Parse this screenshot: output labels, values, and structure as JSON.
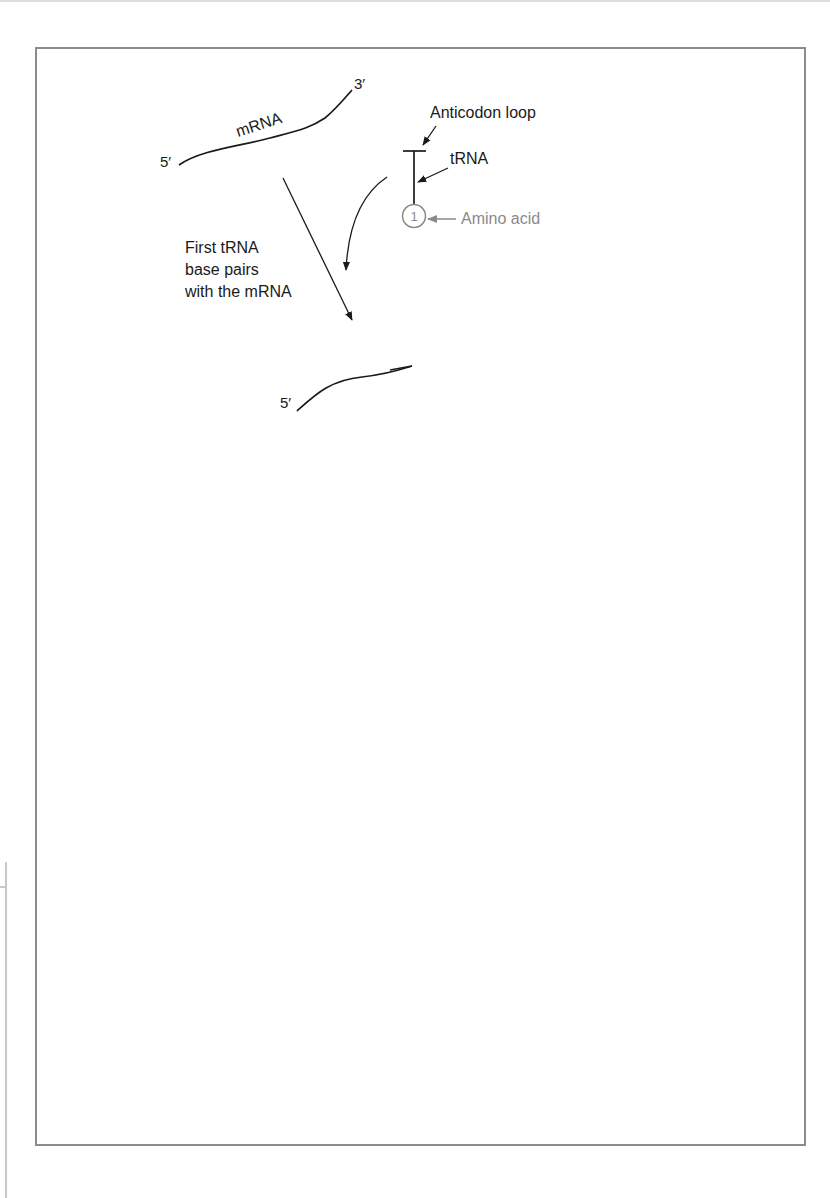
{
  "figure": {
    "colors": {
      "line": "#1a1a1a",
      "amino_acid": "#8a8a8a",
      "frame": "#8c8c8c",
      "background": "#ffffff"
    }
  },
  "stage1": {
    "five_prime": "5′",
    "three_prime": "3′",
    "mrna_label": "mRNA",
    "anticodon_label": "Anticodon loop",
    "trna_label": "tRNA",
    "amino_acid_number": "1",
    "amino_acid_label": "Amino acid"
  },
  "step1": {
    "lines": [
      "First tRNA",
      "base pairs",
      "with the mRNA"
    ]
  },
  "stage2": {
    "five_prime": "5′",
    "three_prime": "3′",
    "base_pairing_label": "Base pairing",
    "amino_acid_number": "1"
  },
  "step2": {
    "lines": [
      "Second tRNA",
      "base pairs"
    ],
    "second_trna_label": "Second tRNA +",
    "second_amino_label": "amino acid",
    "amino_acid_number": "2"
  },
  "stage3": {
    "five_prime": "5′",
    "three_prime": "3′",
    "amino_acid_numbers": [
      "1",
      "2"
    ]
  },
  "step3": {
    "lines": [
      "A peptide bond",
      "is formed"
    ]
  },
  "stage4": {
    "five_prime": "5′",
    "three_prime": "3′",
    "amino_acid_numbers": [
      "1",
      "2"
    ],
    "peptide_bond_label": "Peptide bond",
    "dissociate_lines": [
      "First tRNA",
      "dissociates"
    ]
  }
}
